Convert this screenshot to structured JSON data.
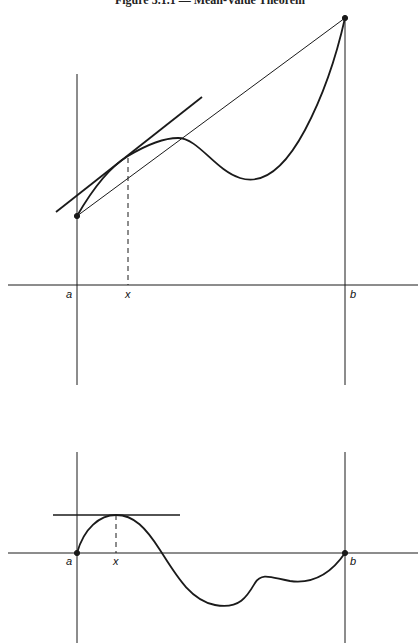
{
  "title": "Figure 3.1.1 — Mean-Value Theorem",
  "colors": {
    "ink": "#1a1a1a",
    "background": "#ffffff"
  },
  "top_figure": {
    "description": "Graph of f on [a,b] with secant line from (a,f(a)) to (b,f(b)) and a parallel tangent line at x",
    "labels": {
      "a": "a",
      "x": "x",
      "b": "b"
    },
    "elements": [
      "x-axis",
      "vertical line at a",
      "vertical line at b",
      "curve f",
      "secant line",
      "tangent line at x",
      "dashed drop line at x",
      "endpoint dots"
    ]
  },
  "bottom_figure": {
    "description": "Graph of g = f minus secant, with g(a)=g(b)=0 and horizontal tangent at x",
    "labels": {
      "a": "a",
      "x": "x",
      "b": "b"
    },
    "elements": [
      "x-axis",
      "vertical line at a",
      "vertical line at b",
      "curve g",
      "horizontal tangent line at x",
      "dashed drop line at x",
      "endpoint dots"
    ]
  }
}
